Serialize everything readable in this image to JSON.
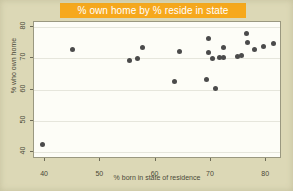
{
  "chart_data": {
    "type": "scatter",
    "title": "% own home by % reside in state",
    "xlabel": "% born in state of residence",
    "ylabel": "% who own home",
    "xlim": [
      38.0,
      82.5
    ],
    "ylim": [
      38.5,
      81.5
    ],
    "xticks": [
      40,
      50,
      60,
      70,
      80
    ],
    "yticks": [
      40,
      50,
      60,
      70,
      80
    ],
    "grid": "horizontal",
    "legend": null,
    "marker_color": "#4b4b4b",
    "points": [
      {
        "x": 39.5,
        "y": 42.5
      },
      {
        "x": 45.0,
        "y": 72.8
      },
      {
        "x": 55.3,
        "y": 69.3
      },
      {
        "x": 56.8,
        "y": 69.9
      },
      {
        "x": 57.6,
        "y": 73.4
      },
      {
        "x": 63.5,
        "y": 62.5
      },
      {
        "x": 64.4,
        "y": 72.0
      },
      {
        "x": 69.2,
        "y": 63.3
      },
      {
        "x": 69.5,
        "y": 76.1
      },
      {
        "x": 69.6,
        "y": 71.7
      },
      {
        "x": 70.2,
        "y": 69.9
      },
      {
        "x": 70.8,
        "y": 60.4
      },
      {
        "x": 71.6,
        "y": 70.2
      },
      {
        "x": 72.2,
        "y": 70.3
      },
      {
        "x": 72.3,
        "y": 73.3
      },
      {
        "x": 74.9,
        "y": 70.5
      },
      {
        "x": 75.6,
        "y": 70.7
      },
      {
        "x": 76.4,
        "y": 77.7
      },
      {
        "x": 76.6,
        "y": 75.1
      },
      {
        "x": 77.9,
        "y": 72.7
      },
      {
        "x": 79.5,
        "y": 73.8
      },
      {
        "x": 81.4,
        "y": 74.8
      }
    ]
  },
  "colors": {
    "page_background": "#dcd8b6",
    "title_band": "#f6a81c",
    "title_text": "#ffffff",
    "plot_background": "#fdfdf7",
    "axis": "#6d6b58",
    "gridline": "#e6e6dc",
    "marker": "#4b4b4b"
  }
}
